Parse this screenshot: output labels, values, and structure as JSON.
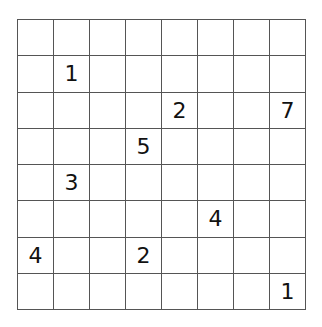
{
  "puzzle": {
    "rows": 8,
    "cols": 8,
    "cells": [
      [
        "",
        "",
        "",
        "",
        "",
        "",
        "",
        ""
      ],
      [
        "",
        "1",
        "",
        "",
        "",
        "",
        "",
        ""
      ],
      [
        "",
        "",
        "",
        "",
        "2",
        "",
        "",
        "7"
      ],
      [
        "",
        "",
        "",
        "5",
        "",
        "",
        "",
        ""
      ],
      [
        "",
        "3",
        "",
        "",
        "",
        "",
        "",
        ""
      ],
      [
        "",
        "",
        "",
        "",
        "",
        "4",
        "",
        ""
      ],
      [
        "4",
        "",
        "",
        "2",
        "",
        "",
        "",
        ""
      ],
      [
        "",
        "",
        "",
        "",
        "",
        "",
        "",
        "1"
      ]
    ]
  }
}
